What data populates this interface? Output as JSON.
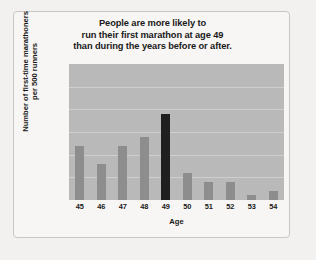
{
  "chart_data": {
    "type": "bar",
    "title": "People are more likely to run their first marathon at age 49 than during the years before or after.",
    "title_lines": [
      "People are more likely to",
      "run their first marathon at age 49",
      "than during the years before or after."
    ],
    "xlabel": "Age",
    "ylabel": "Number of first-time marathoners per 500 runners",
    "ylabel_lines": [
      "Number of first-time marathoners",
      "per 500 runners"
    ],
    "categories": [
      "45",
      "46",
      "47",
      "48",
      "49",
      "50",
      "51",
      "52",
      "53",
      "54"
    ],
    "values": [
      12,
      8,
      12,
      14,
      19,
      6,
      4,
      4,
      1,
      2
    ],
    "ylim": [
      0,
      30
    ],
    "yticks": [
      "0",
      "5",
      "10",
      "15",
      "20",
      "25",
      "30"
    ],
    "ytick_values": [
      0,
      5,
      10,
      15,
      20,
      25,
      30
    ],
    "grid": true,
    "legend": "none",
    "highlight_category": "49",
    "colors": {
      "bar": "#8d8d8d",
      "bar_highlight": "#201f1f",
      "plot_background": "#b9b9b9",
      "gridline": "#cfcfcf",
      "figure_background": "#f7f6f4",
      "page_background": "#f2f1ef",
      "frame_border": "#c8c7c4",
      "text": "#1a1a1a"
    }
  }
}
